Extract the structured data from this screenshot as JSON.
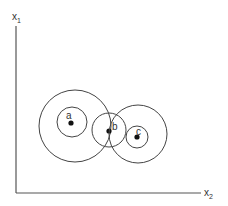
{
  "diagram": {
    "axes": {
      "vertical_label": "x",
      "vertical_subscript": "1",
      "horizontal_label": "x",
      "horizontal_subscript": "2"
    },
    "points": [
      {
        "id": "a",
        "label": "a"
      },
      {
        "id": "b",
        "label": "b"
      },
      {
        "id": "c",
        "label": "c"
      }
    ],
    "colors": {
      "line": "#444444",
      "dot": "#111111",
      "background": "#ffffff"
    }
  }
}
